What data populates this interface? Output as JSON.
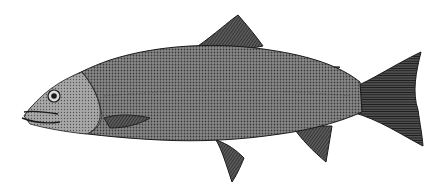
{
  "image": {
    "subject": "trout illustration",
    "style": "engraving",
    "background_color": "#ffffff",
    "ink_color": "#1a1a1a",
    "body_tone": "#6f6f6f",
    "head_tone": "#9a9a9a"
  }
}
